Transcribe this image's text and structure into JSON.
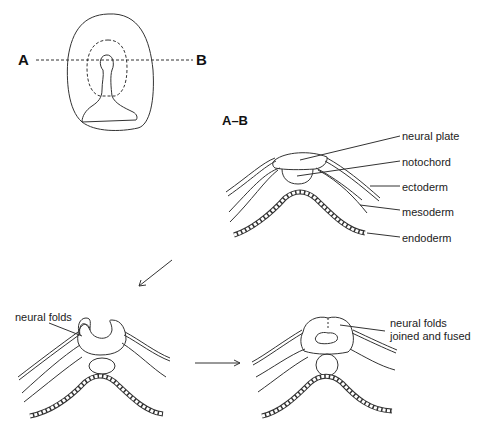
{
  "figure": {
    "top_view": {
      "label_a": "A",
      "label_b": "B"
    },
    "section_label": "A–B",
    "stage1_labels": {
      "neural_plate": "neural plate",
      "notochord": "notochord",
      "ectoderm": "ectoderm",
      "mesoderm": "mesoderm",
      "endoderm": "endoderm"
    },
    "stage2_labels": {
      "neural_folds": "neural folds"
    },
    "stage3_labels": {
      "line1": "neural folds",
      "line2": "joined and fused"
    },
    "colors": {
      "line": "#333333",
      "background": "#ffffff"
    }
  }
}
